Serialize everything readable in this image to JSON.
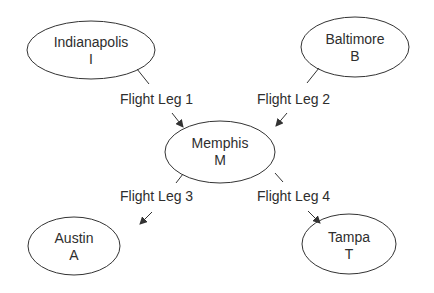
{
  "diagram": {
    "type": "flight-route-network",
    "stroke_color": "#333333",
    "nodes": [
      {
        "id": "I",
        "name": "Indianapolis",
        "code": "I"
      },
      {
        "id": "B",
        "name": "Baltimore",
        "code": "B"
      },
      {
        "id": "M",
        "name": "Memphis",
        "code": "M"
      },
      {
        "id": "A",
        "name": "Austin",
        "code": "A"
      },
      {
        "id": "T",
        "name": "Tampa",
        "code": "T"
      }
    ],
    "edges": [
      {
        "from": "I",
        "to": "M",
        "label": "Flight Leg 1"
      },
      {
        "from": "B",
        "to": "M",
        "label": "Flight Leg 2"
      },
      {
        "from": "M",
        "to": "A",
        "label": "Flight Leg 3"
      },
      {
        "from": "M",
        "to": "T",
        "label": "Flight Leg 4"
      }
    ]
  }
}
